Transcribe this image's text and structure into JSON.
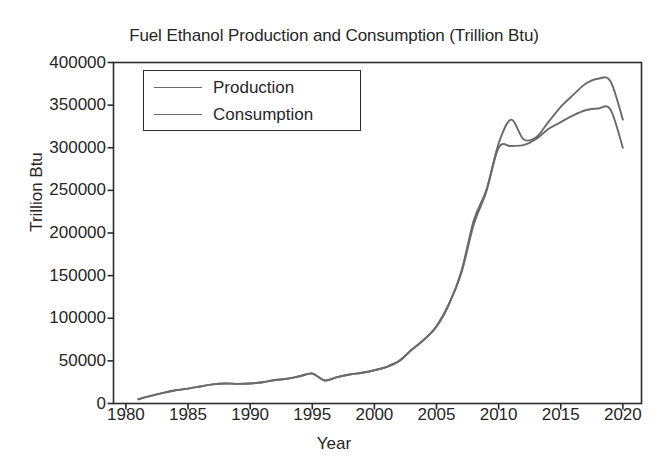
{
  "chart_data": {
    "type": "line",
    "title": "Fuel Ethanol Production and Consumption (Trillion Btu)",
    "xlabel": "Year",
    "ylabel": "Trillion Btu",
    "xlim": [
      1979,
      2021.5
    ],
    "ylim": [
      0,
      400000
    ],
    "grid": false,
    "legend_position": "upper left",
    "xticks": [
      1980,
      1985,
      1990,
      1995,
      2000,
      2005,
      2010,
      2015,
      2020
    ],
    "xtick_labels": [
      "1980",
      "1985",
      "1990",
      "1995",
      "2000",
      "2005",
      "2010",
      "2015",
      "2020"
    ],
    "yticks": [
      0,
      50000,
      100000,
      150000,
      200000,
      250000,
      300000,
      350000,
      400000
    ],
    "ytick_labels": [
      "0",
      "50000",
      "100000",
      "150000",
      "200000",
      "250000",
      "300000",
      "350000",
      "400000"
    ],
    "line_color": "#6b6b6b",
    "axis_color": "#2b2b2b",
    "x": [
      1981,
      1982,
      1983,
      1984,
      1985,
      1986,
      1987,
      1988,
      1989,
      1990,
      1991,
      1992,
      1993,
      1994,
      1995,
      1996,
      1997,
      1998,
      1999,
      2000,
      2001,
      2002,
      2003,
      2004,
      2005,
      2006,
      2007,
      2008,
      2009,
      2010,
      2011,
      2012,
      2013,
      2014,
      2015,
      2016,
      2017,
      2018,
      2019,
      2020
    ],
    "series": [
      {
        "name": "Production",
        "values": [
          5000,
          9000,
          12500,
          15500,
          17500,
          20000,
          22500,
          23500,
          23000,
          23500,
          25000,
          27500,
          29000,
          32000,
          35000,
          27000,
          31000,
          34000,
          36000,
          39000,
          43000,
          50000,
          63000,
          75000,
          90000,
          116000,
          155000,
          215000,
          250000,
          305000,
          333000,
          310000,
          312000,
          330000,
          348000,
          362000,
          375000,
          381000,
          378000,
          333000
        ]
      },
      {
        "name": "Consumption",
        "values": [
          5000,
          9000,
          12500,
          15500,
          17500,
          20000,
          22500,
          23500,
          23000,
          23500,
          25000,
          27500,
          29000,
          32000,
          35000,
          27000,
          31000,
          34000,
          36000,
          39000,
          43000,
          50000,
          63000,
          75000,
          91000,
          117000,
          153000,
          210000,
          248000,
          300000,
          302000,
          303000,
          310000,
          322000,
          330000,
          338000,
          344000,
          346000,
          345000,
          300000
        ]
      }
    ]
  },
  "legend": {
    "entries": [
      {
        "label": "Production"
      },
      {
        "label": "Consumption"
      }
    ]
  }
}
